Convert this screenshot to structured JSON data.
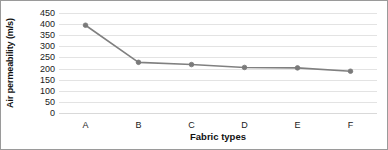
{
  "chart_data": {
    "type": "line",
    "title": "",
    "xlabel": "Fabric types",
    "ylabel": "Air permeability (m/s)",
    "categories": [
      "A",
      "B",
      "C",
      "D",
      "E",
      "F"
    ],
    "values": [
      395,
      228,
      218,
      205,
      203,
      188
    ],
    "series": [
      {
        "name": "Air permeability",
        "values": [
          395,
          228,
          218,
          205,
          203,
          188
        ]
      }
    ],
    "ylim": [
      0,
      450
    ],
    "ytick_step": 50,
    "yticks": [
      450,
      400,
      350,
      300,
      250,
      200,
      150,
      100,
      50,
      0
    ],
    "grid": true,
    "legend": "none",
    "line_color": "#808080",
    "marker_color": "#7a7a7a",
    "grid_color": "#e3e3e3",
    "border_color": "#9a9a9a"
  }
}
